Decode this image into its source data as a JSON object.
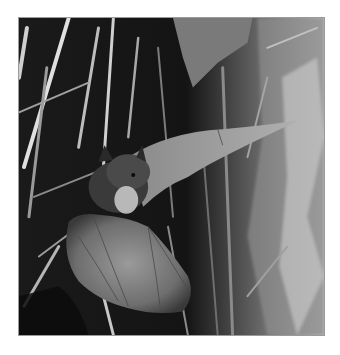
{
  "image": {
    "subject": "bat in flight",
    "alt": "Black and white photograph of a bat flying among plant stems and leaves",
    "colors": {
      "background": "#ffffff",
      "border": "#9a9a9a",
      "dark": "#111111",
      "light": "#d8d8d8"
    }
  }
}
